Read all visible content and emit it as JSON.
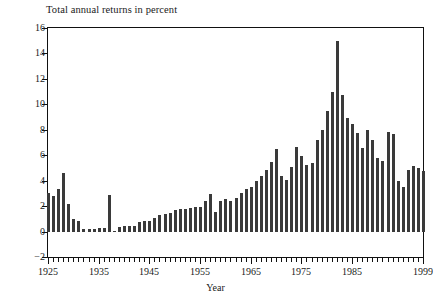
{
  "chart_data": {
    "type": "bar",
    "title": "Total annual returns in percent",
    "xlabel": "Year",
    "ylabel": "",
    "ylim": [
      -2,
      16
    ],
    "yticks": [
      -2,
      0,
      2,
      4,
      6,
      8,
      10,
      12,
      14,
      16
    ],
    "xlim": [
      1925,
      1999
    ],
    "xticks": [
      1925,
      1935,
      1945,
      1955,
      1965,
      1975,
      1985,
      1999
    ],
    "grid": false,
    "legend": null,
    "bar_color": "#3a3a3a",
    "categories": [
      1925,
      1926,
      1927,
      1928,
      1929,
      1930,
      1931,
      1932,
      1933,
      1934,
      1935,
      1936,
      1937,
      1938,
      1939,
      1940,
      1941,
      1942,
      1943,
      1944,
      1945,
      1946,
      1947,
      1948,
      1949,
      1950,
      1951,
      1952,
      1953,
      1954,
      1955,
      1956,
      1957,
      1958,
      1959,
      1960,
      1961,
      1962,
      1963,
      1964,
      1965,
      1966,
      1967,
      1968,
      1969,
      1970,
      1971,
      1972,
      1973,
      1974,
      1975,
      1976,
      1977,
      1978,
      1979,
      1980,
      1981,
      1982,
      1983,
      1984,
      1985,
      1986,
      1987,
      1988,
      1989,
      1990,
      1991,
      1992,
      1993,
      1994,
      1995,
      1996,
      1997,
      1998,
      1999
    ],
    "values": [
      3.1,
      2.8,
      3.4,
      4.6,
      2.2,
      1.0,
      0.9,
      0.2,
      0.2,
      0.2,
      0.3,
      0.3,
      2.9,
      0.1,
      0.4,
      0.5,
      0.5,
      0.5,
      0.8,
      0.9,
      0.9,
      1.1,
      1.3,
      1.4,
      1.5,
      1.7,
      1.8,
      1.8,
      1.9,
      2.0,
      2.0,
      2.4,
      3.0,
      1.6,
      2.4,
      2.6,
      2.4,
      2.7,
      3.1,
      3.4,
      3.5,
      4.0,
      4.4,
      4.9,
      5.5,
      6.5,
      4.4,
      4.1,
      5.1,
      6.7,
      6.0,
      5.3,
      5.4,
      7.2,
      8.0,
      9.5,
      11.0,
      15.0,
      10.8,
      9.0,
      8.5,
      7.8,
      6.6,
      8.0,
      7.2,
      5.8,
      5.6,
      7.9,
      7.7,
      4.0,
      3.5,
      4.9,
      5.2,
      5.0,
      4.8
    ]
  }
}
